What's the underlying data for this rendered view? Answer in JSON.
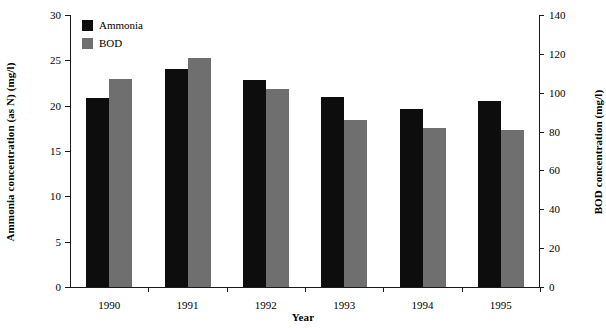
{
  "chart_data": {
    "type": "bar",
    "title": "",
    "xlabel": "Year",
    "categories": [
      "1990",
      "1991",
      "1992",
      "1993",
      "1994",
      "1995"
    ],
    "series": [
      {
        "name": "Ammonia",
        "axis": "left",
        "color": "#0d0d0d",
        "unit": "mg/l",
        "values": [
          20.8,
          24.0,
          22.8,
          21.0,
          19.6,
          20.5
        ]
      },
      {
        "name": "BOD",
        "axis": "right",
        "color": "#6f6f6f",
        "unit": "mg/l",
        "values": [
          107,
          118,
          102,
          86,
          82,
          81
        ]
      }
    ],
    "left_axis": {
      "label": "Ammonia concentration (as N) (mg/l)",
      "ylim": [
        0,
        30
      ],
      "ticks": [
        "0",
        "5",
        "10",
        "15",
        "20",
        "25",
        "30"
      ],
      "tick_values": [
        0,
        5,
        10,
        15,
        20,
        25,
        30
      ]
    },
    "right_axis": {
      "label": "BOD concentration (mg/l)",
      "ylim": [
        0,
        140
      ],
      "ticks": [
        "0",
        "20",
        "40",
        "60",
        "80",
        "100",
        "120",
        "140"
      ],
      "tick_values": [
        0,
        20,
        40,
        60,
        80,
        100,
        120,
        140
      ]
    },
    "legend": {
      "position": "top-left",
      "entries": [
        "Ammonia",
        "BOD"
      ]
    },
    "grid": false
  }
}
